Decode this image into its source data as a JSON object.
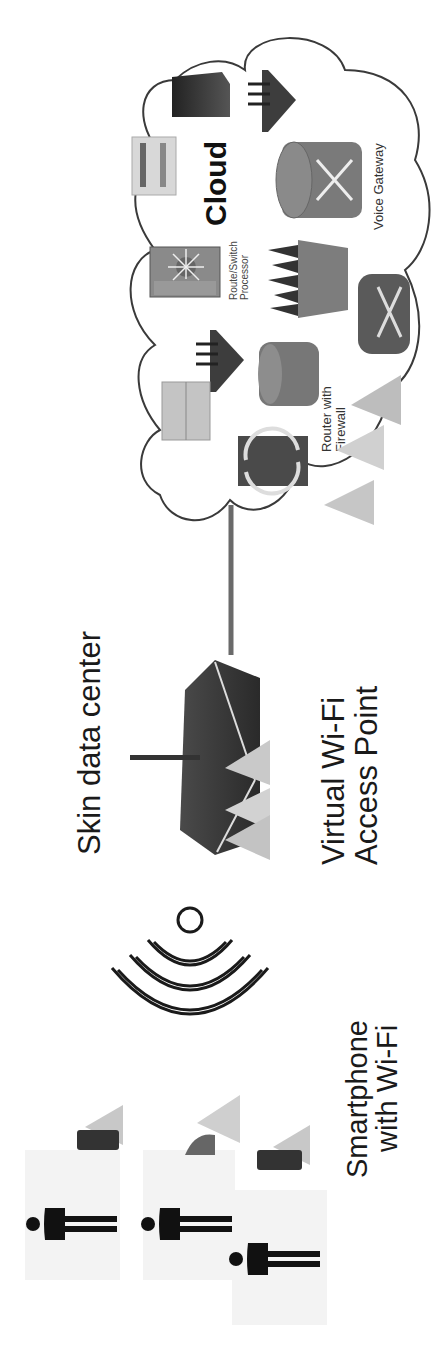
{
  "diagram": {
    "orientation": "rotated-90-ccw",
    "labels": {
      "data_center": "Skin data center",
      "access_point_line1": "Virtual Wi-Fi",
      "access_point_line2": "Access Point",
      "smartphone_line1": "Smartphone",
      "smartphone_line2": "with Wi-Fi",
      "cloud": "Cloud",
      "route_switch_line1": "Route/Switch",
      "route_switch_line2": "Processor",
      "router_firewall_line1": "Router with",
      "router_firewall_line2": "Firewall",
      "voice_gateway": "Voice Gateway"
    },
    "nodes": [
      {
        "id": "user-1",
        "type": "person-with-smartphone"
      },
      {
        "id": "user-2",
        "type": "person-with-smartphone"
      },
      {
        "id": "user-3",
        "type": "person-with-smartphone"
      },
      {
        "id": "wifi-signal",
        "type": "wireless-signal"
      },
      {
        "id": "access-point",
        "type": "wireless-access-point"
      },
      {
        "id": "cloud",
        "type": "network-cloud"
      }
    ],
    "cloud_devices": [
      "server-rack",
      "wireless-router",
      "route-switch-processor",
      "access-server",
      "server",
      "wireless-router",
      "router-with-firewall",
      "firewall",
      "voice-gateway",
      "router",
      "bidirectional-switch"
    ],
    "edges": [
      {
        "from": "smartphones",
        "to": "access-point",
        "type": "wireless"
      },
      {
        "from": "access-point",
        "to": "cloud",
        "type": "wired"
      }
    ],
    "colors": {
      "ink": "#1a1a1a",
      "device_gray": "#7a7a7a",
      "device_dark": "#3a3a3a",
      "triangle_gray": "#c8c8c8",
      "line": "#5a5a5a"
    }
  }
}
